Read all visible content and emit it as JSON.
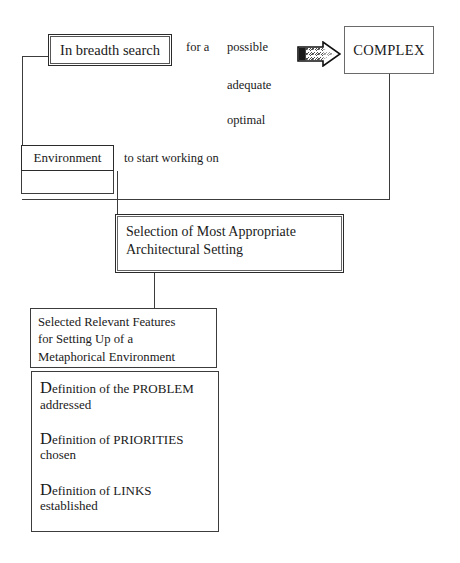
{
  "diagram": {
    "title_node": {
      "label": "In breadth search"
    },
    "target_node": {
      "label": "COMPLEX"
    },
    "connector_arrow": {
      "icon": "block-arrow-right-icon"
    },
    "qualifier_phrases": {
      "for_a": "for a",
      "options": [
        "possible",
        "adequate",
        "optimal"
      ]
    },
    "environment_node": {
      "label": "Environment"
    },
    "environment_phrase": "to start working on",
    "selection_node": {
      "line1": "Selection of Most Appropriate",
      "line2": "Architectural Setting"
    },
    "features_node": {
      "line1": "Selected Relevant Features",
      "line2": "for Setting Up of  a",
      "line3": "Metaphorical Environment"
    },
    "definitions_node": {
      "items": [
        {
          "dropcap": "D",
          "head_rest": "efinition of the PROBLEM",
          "sub": "addressed"
        },
        {
          "dropcap": "D",
          "head_rest": "efinition of PRIORITIES",
          "sub": "chosen"
        },
        {
          "dropcap": "D",
          "head_rest": "efinition of LINKS",
          "sub": "established"
        }
      ]
    },
    "colors": {
      "background": "#ffffff",
      "ink": "#1a1a1a",
      "stroke": "#3c3c3c",
      "stroke_heavy": "#2b2b2b"
    }
  }
}
